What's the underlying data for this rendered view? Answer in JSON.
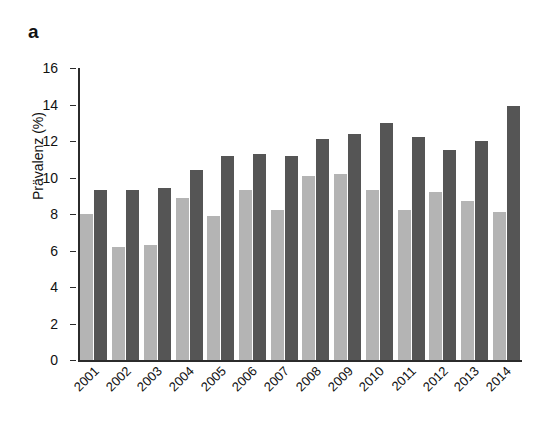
{
  "panel": {
    "label": "a"
  },
  "chart_data": {
    "type": "bar",
    "title": "",
    "subtitle": "",
    "xlabel": "",
    "ylabel": "Prävalenz (%)",
    "categories": [
      "2001",
      "2002",
      "2003",
      "2004",
      "2005",
      "2006",
      "2007",
      "2008",
      "2009",
      "2010",
      "2011",
      "2012",
      "2013",
      "2014"
    ],
    "series": [
      {
        "name": "light-gray-series",
        "color": "#b4b4b4",
        "values": [
          8.0,
          6.2,
          6.3,
          8.9,
          7.9,
          9.3,
          8.2,
          10.1,
          10.2,
          9.3,
          8.2,
          9.2,
          8.7,
          8.1
        ]
      },
      {
        "name": "dark-gray-series",
        "color": "#555555",
        "values": [
          9.3,
          9.3,
          9.4,
          10.4,
          11.2,
          11.3,
          11.2,
          12.1,
          12.4,
          13.0,
          12.2,
          11.5,
          12.0,
          13.9
        ]
      }
    ],
    "ylim": [
      0,
      16
    ],
    "yticks": [
      0,
      2,
      4,
      6,
      8,
      10,
      12,
      14,
      16
    ],
    "ytick_labels": [
      "0",
      "2",
      "4",
      "6",
      "8",
      "10",
      "12",
      "14",
      "16"
    ],
    "grid": false,
    "legend": "none",
    "xtick_rotation": -45
  }
}
